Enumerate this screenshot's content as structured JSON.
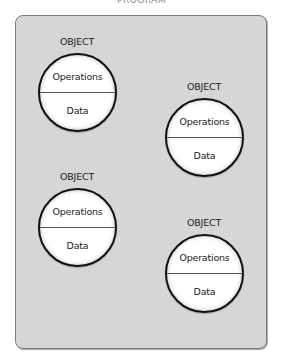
{
  "title": "PROGRAM",
  "objects": [
    {
      "label": "OBJECT",
      "operations": "Operations",
      "data": "Data"
    },
    {
      "label": "OBJECT",
      "operations": "Operations",
      "data": "Data"
    },
    {
      "label": "OBJECT",
      "operations": "Operations",
      "data": "Data"
    },
    {
      "label": "OBJECT",
      "operations": "Operations",
      "data": "Data"
    }
  ]
}
